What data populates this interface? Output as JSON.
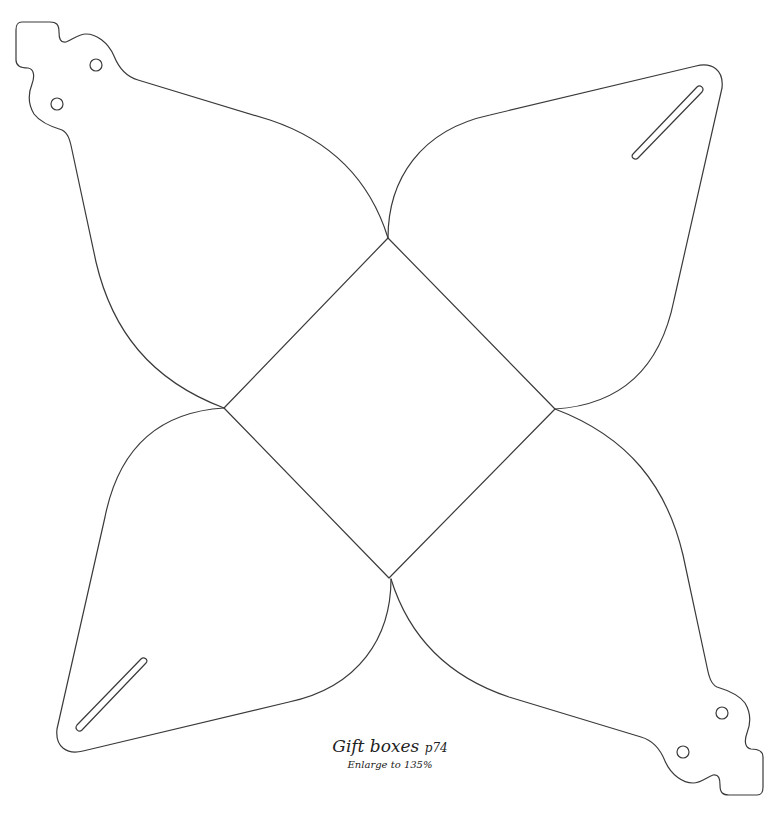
{
  "diagram": {
    "type": "papercraft-template",
    "line_color": "#3a3a3a",
    "background": "#ffffff",
    "parts": [
      {
        "name": "center-square-base",
        "shape": "diamond"
      },
      {
        "name": "petal-top-left",
        "features": [
          "tab",
          "hole",
          "hole"
        ]
      },
      {
        "name": "petal-top-right",
        "features": [
          "slot"
        ]
      },
      {
        "name": "petal-bottom-right",
        "features": [
          "tab",
          "hole",
          "hole"
        ]
      },
      {
        "name": "petal-bottom-left",
        "features": [
          "slot"
        ]
      }
    ]
  },
  "caption": {
    "title": "Gift boxes",
    "page_ref": "p74",
    "instruction": "Enlarge to 135%"
  }
}
